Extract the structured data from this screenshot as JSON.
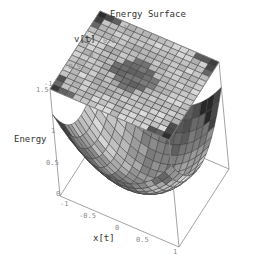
{
  "chart_data": {
    "type": "surface3d",
    "title": "Energy Surface",
    "xlabel": "x[t]",
    "ylabel": "v[t]",
    "zlabel": "Energy",
    "x_range": [
      -1,
      1
    ],
    "y_range": [
      -1,
      1
    ],
    "z_range": [
      0,
      1.5
    ],
    "x_ticks": [
      "-1",
      "-0.5",
      "0",
      "0.5",
      "1"
    ],
    "y_ticks": [
      "-1",
      "-0.5",
      "0",
      "0.5",
      "1"
    ],
    "z_ticks": [
      "0",
      "0.5",
      "1",
      "1.5"
    ],
    "grid_divisions": 16,
    "surfaces": [
      {
        "name": "Energy (paraboloid)",
        "formula": "0.5*x^2 + 0.5*v^2 (bowl)",
        "shading": "grayscale"
      },
      {
        "name": "Energy projection plane",
        "formula": "top plane at z=1.5 shaded by energy",
        "shading": "grayscale"
      }
    ],
    "box": true,
    "grid": false,
    "legend": null
  },
  "labels": {
    "title": "Energy Surface",
    "x_axis": "x[t]",
    "y_axis": "v[t]",
    "z_axis": "Energy"
  },
  "ticks": {
    "x": [
      {
        "t": "-1",
        "x": 60,
        "y": 201
      },
      {
        "t": "-0.5",
        "x": 79,
        "y": 213
      },
      {
        "t": "0",
        "x": 115,
        "y": 225
      },
      {
        "t": "0.5",
        "x": 136,
        "y": 237
      },
      {
        "t": "1",
        "x": 173,
        "y": 249
      }
    ],
    "y": [
      {
        "t": "-1",
        "x": 44,
        "y": 81
      },
      {
        "t": "-0.5",
        "x": 64,
        "y": 64
      },
      {
        "t": "0",
        "x": 89,
        "y": 53
      },
      {
        "t": "0.5",
        "x": 103,
        "y": 38
      },
      {
        "t": "1",
        "x": 123,
        "y": 25
      }
    ],
    "z": [
      {
        "t": "1.5",
        "x": 36,
        "y": 87
      },
      {
        "t": "1",
        "x": 51,
        "y": 128
      },
      {
        "t": "0.5",
        "x": 46,
        "y": 160
      },
      {
        "t": "0",
        "x": 56,
        "y": 191
      }
    ]
  },
  "colors": {
    "box_line": "#8c8c8c",
    "mesh_line": "#3a3a3a",
    "text": "#333333",
    "tick_text": "#8a8a8a"
  }
}
